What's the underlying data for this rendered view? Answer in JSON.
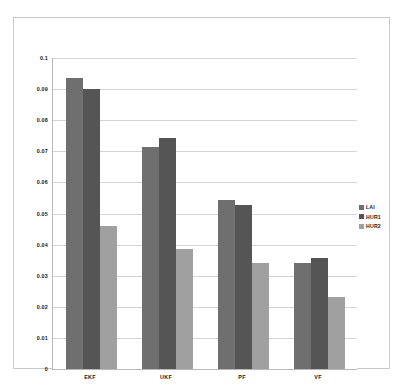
{
  "chart_data": {
    "type": "bar",
    "title": "",
    "subtitle": "",
    "xlabel": "",
    "ylabel": "",
    "categories": [
      "EKF",
      "UKF",
      "PF",
      "VF"
    ],
    "series": [
      {
        "name": "LAI",
        "color": "#6f6f6f",
        "values": [
          0.0935,
          0.0715,
          0.0543,
          0.0342
        ]
      },
      {
        "name": "HUR1",
        "color": "#555555",
        "values": [
          0.09,
          0.0743,
          0.0527,
          0.0357
        ]
      },
      {
        "name": "HUR2",
        "color": "#a0a0a0",
        "values": [
          0.046,
          0.0385,
          0.034,
          0.0233
        ]
      }
    ],
    "ylim": [
      0,
      0.1
    ],
    "ytick_step": 0.01,
    "ytick_labels": [
      "0",
      "0.01",
      "0.02",
      "0.03",
      "0.04",
      "0.05",
      "0.06",
      "0.07",
      "0.08",
      "0.09",
      "0.1"
    ],
    "grid": true,
    "grid_axis": "y",
    "legend_position": "right",
    "plot_background": "#ffffff",
    "grid_color": "#d4d4d4",
    "axis_color": "#b9b9b9",
    "frame_color": "#c9c9c9",
    "text_color": "#1a1a1a"
  }
}
